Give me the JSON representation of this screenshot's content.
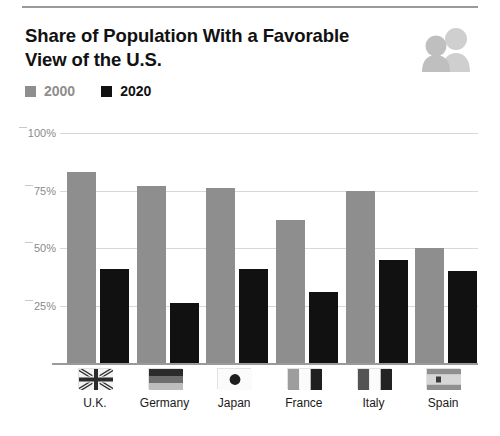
{
  "header": {
    "title": "Share of Population With a Favorable View of the U.S.",
    "icon": "two-people-icon"
  },
  "legend": {
    "items": [
      {
        "label": "2000",
        "color": "#8e8e8e"
      },
      {
        "label": "2020",
        "color": "#111111"
      }
    ]
  },
  "colors": {
    "series_2000": "#8e8e8e",
    "series_2020": "#111111",
    "gridline": "#d8d8d8",
    "axis": "#9a9a9a",
    "tick_text": "#8a8a8a",
    "background": "#ffffff"
  },
  "chart_data": {
    "type": "bar",
    "title": "Share of Population With a Favorable View of the U.S.",
    "xlabel": "",
    "ylabel": "",
    "ylim": [
      0,
      100
    ],
    "yticks": [
      25,
      50,
      75,
      100
    ],
    "ytick_labels": [
      "25%",
      "50%",
      "75%",
      "100%"
    ],
    "grid": true,
    "legend_position": "top-left",
    "categories": [
      "U.K.",
      "Germany",
      "Japan",
      "France",
      "Italy",
      "Spain"
    ],
    "series": [
      {
        "name": "2000",
        "color": "#8e8e8e",
        "values": [
          83,
          77,
          76,
          62,
          75,
          50
        ]
      },
      {
        "name": "2020",
        "color": "#111111",
        "values": [
          41,
          26,
          41,
          31,
          45,
          40
        ]
      }
    ],
    "flags": [
      "uk-flag",
      "germany-flag",
      "japan-flag",
      "france-flag",
      "italy-flag",
      "spain-flag"
    ]
  }
}
